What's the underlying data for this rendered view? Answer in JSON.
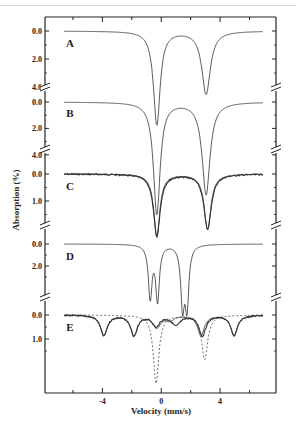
{
  "chart_data": {
    "type": "line",
    "title": "",
    "xlabel": "Velocity (mm/s)",
    "ylabel": "Absorption (%)",
    "xlim": [
      -7.9,
      7.8
    ],
    "x_ticks_major": [
      -4,
      0,
      4
    ],
    "x_tick_labels": [
      "-4",
      "0",
      "4"
    ],
    "x_ticks_minor": [
      -6,
      -2,
      2,
      6
    ],
    "grid": false,
    "legend": "none",
    "y_axis_inverted": true,
    "y_axis_broken": true,
    "panels": [
      {
        "label": "A",
        "y_tick_labels": [
          "0.0",
          "2.0",
          "4.0"
        ],
        "y_ticks": [
          0.0,
          2.0,
          4.0
        ],
        "ylim": [
          0.0,
          7.0
        ],
        "series": [
          {
            "name": "measured+fit",
            "style": "solid",
            "peaks": [
              {
                "position": -0.3,
                "depth": 6.7,
                "width": 0.55
              },
              {
                "position": 3.05,
                "depth": 4.5,
                "width": 0.7
              }
            ]
          }
        ]
      },
      {
        "label": "B",
        "y_tick_labels": [
          "0.0",
          "2.0",
          "4.0"
        ],
        "y_ticks": [
          0.0,
          2.0,
          4.0
        ],
        "ylim": [
          0.0,
          7.0
        ],
        "series": [
          {
            "name": "measured+fit",
            "style": "solid",
            "peaks": [
              {
                "position": -0.3,
                "depth": 8.5,
                "width": 0.55
              },
              {
                "position": 3.05,
                "depth": 7.0,
                "width": 0.65
              }
            ]
          }
        ]
      },
      {
        "label": "C",
        "y_tick_labels": [
          "0.0",
          "1.0"
        ],
        "y_ticks": [
          0.0,
          1.0
        ],
        "ylim": [
          0.0,
          2.6
        ],
        "series": [
          {
            "name": "measured",
            "style": "noisy",
            "peaks": [
              {
                "position": -0.3,
                "depth": 2.3,
                "width": 0.55
              },
              {
                "position": 3.15,
                "depth": 2.05,
                "width": 0.6
              }
            ]
          },
          {
            "name": "fit",
            "style": "solid",
            "peaks": [
              {
                "position": -0.3,
                "depth": 2.3,
                "width": 0.5
              },
              {
                "position": 3.15,
                "depth": 2.05,
                "width": 0.55
              }
            ]
          }
        ]
      },
      {
        "label": "D",
        "y_tick_labels": [
          "0.0",
          "2.0"
        ],
        "y_ticks": [
          0.0,
          2.0
        ],
        "ylim": [
          0.0,
          6.0
        ],
        "series": [
          {
            "name": "measured+fit",
            "style": "solid",
            "peaks": [
              {
                "position": -0.75,
                "depth": 4.8,
                "width": 0.3
              },
              {
                "position": -0.25,
                "depth": 5.0,
                "width": 0.3
              },
              {
                "position": 1.45,
                "depth": 5.4,
                "width": 0.3
              },
              {
                "position": 1.75,
                "depth": 5.4,
                "width": 0.3
              }
            ]
          }
        ]
      },
      {
        "label": "E",
        "y_tick_labels": [
          "0.0",
          "1.0"
        ],
        "y_ticks": [
          0.0,
          1.0
        ],
        "ylim": [
          0.0,
          3.4
        ],
        "series": [
          {
            "name": "sextet-measured",
            "style": "noisy",
            "peaks": [
              {
                "position": -3.9,
                "depth": 0.85,
                "width": 0.55
              },
              {
                "position": -1.85,
                "depth": 0.85,
                "width": 0.55
              },
              {
                "position": -0.35,
                "depth": 0.45,
                "width": 0.6
              },
              {
                "position": 1.0,
                "depth": 0.4,
                "width": 0.7
              },
              {
                "position": 2.8,
                "depth": 0.85,
                "width": 0.55
              },
              {
                "position": 4.95,
                "depth": 0.85,
                "width": 0.55
              }
            ]
          },
          {
            "name": "sextet-fit",
            "style": "solid",
            "peaks": [
              {
                "position": -3.9,
                "depth": 0.85,
                "width": 0.55
              },
              {
                "position": -1.85,
                "depth": 0.85,
                "width": 0.55
              },
              {
                "position": -0.3,
                "depth": 0.5,
                "width": 0.65
              },
              {
                "position": 0.6,
                "depth": 0.2,
                "width": 0.6
              },
              {
                "position": 2.7,
                "depth": 0.85,
                "width": 0.55
              },
              {
                "position": 4.95,
                "depth": 0.85,
                "width": 0.55
              }
            ]
          },
          {
            "name": "doublet-component",
            "style": "dashed",
            "peaks": [
              {
                "position": -0.35,
                "depth": 2.85,
                "width": 0.45
              },
              {
                "position": 2.95,
                "depth": 1.85,
                "width": 0.5
              }
            ]
          }
        ]
      }
    ]
  }
}
